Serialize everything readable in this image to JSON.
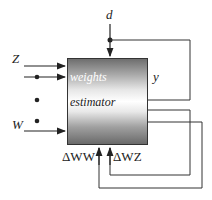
{
  "diagram": {
    "block": {
      "label_top": "weights",
      "label_mid": "estimator"
    },
    "inputs": {
      "z": "Z",
      "w": "W",
      "d": "d"
    },
    "outputs": {
      "y": "y"
    },
    "feedback": {
      "dww": "ΔWW",
      "dwz": "ΔWZ"
    }
  }
}
